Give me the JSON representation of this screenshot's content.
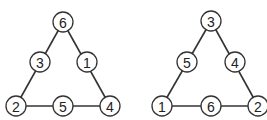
{
  "triangles": [
    {
      "name": "left",
      "nodes": [
        {
          "pos": "top",
          "label": "6",
          "x": 63,
          "y": 22
        },
        {
          "pos": "mid-left",
          "label": "3",
          "x": 40,
          "y": 62
        },
        {
          "pos": "mid-right",
          "label": "1",
          "x": 87,
          "y": 62
        },
        {
          "pos": "bottom-left",
          "label": "2",
          "x": 16,
          "y": 106
        },
        {
          "pos": "bottom-mid",
          "label": "5",
          "x": 63,
          "y": 106
        },
        {
          "pos": "bottom-right",
          "label": "4",
          "x": 110,
          "y": 106
        }
      ]
    },
    {
      "name": "right",
      "nodes": [
        {
          "pos": "top",
          "label": "3",
          "x": 211,
          "y": 21
        },
        {
          "pos": "mid-left",
          "label": "5",
          "x": 187,
          "y": 62
        },
        {
          "pos": "mid-right",
          "label": "4",
          "x": 235,
          "y": 62
        },
        {
          "pos": "bottom-left",
          "label": "1",
          "x": 162,
          "y": 106
        },
        {
          "pos": "bottom-mid",
          "label": "6",
          "x": 211,
          "y": 106
        },
        {
          "pos": "bottom-right",
          "label": "2",
          "x": 258,
          "y": 106
        }
      ]
    }
  ]
}
